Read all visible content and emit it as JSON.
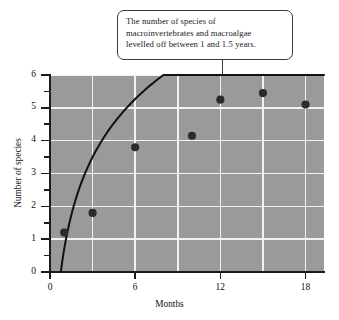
{
  "callout": {
    "name": "annotation-callout",
    "lines": [
      "The number of species of",
      "macroinvertebrates and macroalgae",
      "levelled off between 1 and 1.5 years."
    ],
    "text": "The number of species of macroinvertebrates and macroalgae levelled off between 1 and 1.5 years."
  },
  "chart_data": {
    "type": "scatter",
    "title": "",
    "xlabel": "Months",
    "ylabel": "Number of species",
    "xlim": [
      0,
      19.3
    ],
    "ylim": [
      0,
      6
    ],
    "grid": true,
    "legend": null,
    "plot_background": "#9a9a9a",
    "gridline_color": "#f2f2f2",
    "marker_color": "#2b2b2b",
    "curve_color": "#111111",
    "xticks": [
      0,
      6,
      12,
      18
    ],
    "xtick_labels": [
      "0",
      "6",
      "12",
      "18"
    ],
    "x_gridlines": [
      3,
      6,
      9,
      12,
      15,
      18
    ],
    "yticks": [
      0,
      1,
      2,
      3,
      4,
      5,
      6
    ],
    "ytick_labels": [
      "0",
      "1",
      "2",
      "3",
      "4",
      "5",
      "6"
    ],
    "y_minor_ticks": [
      0.5,
      1.5,
      2.5,
      3.5,
      4.5,
      5.5
    ],
    "points": [
      {
        "x": 1,
        "y": 1.2
      },
      {
        "x": 3,
        "y": 1.8
      },
      {
        "x": 6,
        "y": 3.8
      },
      {
        "x": 10,
        "y": 4.15
      },
      {
        "x": 12,
        "y": 5.25
      },
      {
        "x": 15,
        "y": 5.45
      },
      {
        "x": 18,
        "y": 5.1
      }
    ],
    "series": [
      {
        "name": "Number of species",
        "x": [
          1,
          3,
          6,
          10,
          12,
          15,
          18
        ],
        "values": [
          1.2,
          1.8,
          3.8,
          4.15,
          5.25,
          5.45,
          5.1
        ]
      }
    ],
    "fitted_curve": {
      "name": "logarithmic trend",
      "equation": "y = 2.55*ln(x) + 0.70",
      "x_start": 0.76,
      "x_end": 19.3,
      "y_at_x_end": 5.55
    },
    "annotations": [
      {
        "text": "The number of species of macroinvertebrates and macroalgae levelled off between 1 and 1.5 years.",
        "points_to_x": 12.2,
        "points_to_y": 5.05
      }
    ]
  }
}
